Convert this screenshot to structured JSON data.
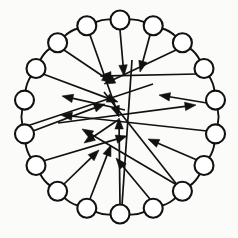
{
  "figure": {
    "title": "Ring graph with radiating direction vectors",
    "type": "node-link-diagram",
    "background_color": "#fbfbfa",
    "stroke_color": "#111111",
    "node_fill_color": "#ffffff",
    "canvas": {
      "width": 238,
      "height": 238
    }
  },
  "geometry": {
    "center": {
      "x": 120,
      "y": 117
    },
    "ring_radius": 97,
    "node_radius": 9.5,
    "node_count": 18
  },
  "nodes": [
    {
      "id": "n0",
      "label": "",
      "angle_deg": 270,
      "x": 120.0,
      "y": 20.0
    },
    {
      "id": "n1",
      "label": "",
      "angle_deg": 290,
      "x": 153.2,
      "y": 25.8
    },
    {
      "id": "n2",
      "label": "",
      "angle_deg": 310,
      "x": 182.4,
      "y": 42.7
    },
    {
      "id": "n3",
      "label": "",
      "angle_deg": 330,
      "x": 204.0,
      "y": 68.5
    },
    {
      "id": "n4",
      "label": "",
      "angle_deg": 350,
      "x": 215.5,
      "y": 100.1
    },
    {
      "id": "n5",
      "label": "",
      "angle_deg": 10,
      "x": 215.5,
      "y": 133.9
    },
    {
      "id": "n6",
      "label": "",
      "angle_deg": 30,
      "x": 204.0,
      "y": 165.5
    },
    {
      "id": "n7",
      "label": "",
      "angle_deg": 50,
      "x": 182.4,
      "y": 191.3
    },
    {
      "id": "n8",
      "label": "",
      "angle_deg": 70,
      "x": 153.2,
      "y": 208.2
    },
    {
      "id": "n9",
      "label": "",
      "angle_deg": 90,
      "x": 120.0,
      "y": 214.0
    },
    {
      "id": "n10",
      "label": "",
      "angle_deg": 110,
      "x": 86.8,
      "y": 208.2
    },
    {
      "id": "n11",
      "label": "",
      "angle_deg": 130,
      "x": 57.6,
      "y": 191.3
    },
    {
      "id": "n12",
      "label": "",
      "angle_deg": 150,
      "x": 36.0,
      "y": 165.5
    },
    {
      "id": "n13",
      "label": "",
      "angle_deg": 170,
      "x": 24.5,
      "y": 133.9
    },
    {
      "id": "n14",
      "label": "",
      "angle_deg": 190,
      "x": 24.5,
      "y": 100.1
    },
    {
      "id": "n15",
      "label": "",
      "angle_deg": 210,
      "x": 36.0,
      "y": 68.5
    },
    {
      "id": "n16",
      "label": "",
      "angle_deg": 230,
      "x": 57.6,
      "y": 42.7
    },
    {
      "id": "n17",
      "label": "",
      "angle_deg": 250,
      "x": 86.8,
      "y": 25.8
    }
  ],
  "ring_edges": [
    {
      "from": "n0",
      "to": "n1"
    },
    {
      "from": "n1",
      "to": "n2"
    },
    {
      "from": "n2",
      "to": "n3"
    },
    {
      "from": "n3",
      "to": "n4"
    },
    {
      "from": "n4",
      "to": "n5"
    },
    {
      "from": "n5",
      "to": "n6"
    },
    {
      "from": "n6",
      "to": "n7"
    },
    {
      "from": "n7",
      "to": "n8"
    },
    {
      "from": "n8",
      "to": "n9"
    },
    {
      "from": "n9",
      "to": "n10"
    },
    {
      "from": "n10",
      "to": "n11"
    },
    {
      "from": "n11",
      "to": "n12"
    },
    {
      "from": "n12",
      "to": "n13"
    },
    {
      "from": "n13",
      "to": "n14"
    },
    {
      "from": "n14",
      "to": "n15"
    },
    {
      "from": "n15",
      "to": "n16"
    },
    {
      "from": "n16",
      "to": "n17"
    },
    {
      "from": "n17",
      "to": "n0"
    }
  ],
  "vectors": [
    {
      "id": "v0",
      "from_node": "n0",
      "tail": {
        "x": 120,
        "y": 30
      },
      "head": {
        "x": 124,
        "y": 76
      },
      "direction": "down"
    },
    {
      "id": "v1",
      "from_node": "n1",
      "tail": {
        "x": 150,
        "y": 35
      },
      "head": {
        "x": 140,
        "y": 72
      },
      "direction": "down-left"
    },
    {
      "id": "v2",
      "from_node": "n2",
      "tail": {
        "x": 176,
        "y": 50
      },
      "head": {
        "x": 104,
        "y": 84
      },
      "direction": "down-left"
    },
    {
      "id": "v3",
      "from_node": "n3",
      "tail": {
        "x": 197,
        "y": 74
      },
      "head": {
        "x": 100,
        "y": 76
      },
      "direction": "left"
    },
    {
      "id": "v4",
      "from_node": "n4",
      "tail": {
        "x": 207,
        "y": 103
      },
      "head": {
        "x": 159,
        "y": 95
      },
      "direction": "left"
    },
    {
      "id": "v5",
      "from_node": "n5",
      "tail": {
        "x": 207,
        "y": 131
      },
      "head": {
        "x": 61,
        "y": 115
      },
      "direction": "left"
    },
    {
      "id": "v6",
      "from_node": "n6",
      "tail": {
        "x": 197,
        "y": 160
      },
      "head": {
        "x": 148,
        "y": 139
      },
      "direction": "up-left"
    },
    {
      "id": "v7",
      "from_node": "n7",
      "tail": {
        "x": 177,
        "y": 185
      },
      "head": {
        "x": 82,
        "y": 129
      },
      "direction": "up-left"
    },
    {
      "id": "v8",
      "from_node": "n8",
      "tail": {
        "x": 150,
        "y": 199
      },
      "head": {
        "x": 116,
        "y": 158
      },
      "direction": "up-left"
    },
    {
      "id": "v9",
      "from_node": "n9",
      "tail": {
        "x": 120,
        "y": 205
      },
      "head": {
        "x": 119,
        "y": 118
      },
      "direction": "up"
    },
    {
      "id": "v10",
      "from_node": "n10",
      "tail": {
        "x": 90,
        "y": 199
      },
      "head": {
        "x": 111,
        "y": 145
      },
      "direction": "up-right"
    },
    {
      "id": "v11",
      "from_node": "n11",
      "tail": {
        "x": 63,
        "y": 185
      },
      "head": {
        "x": 99,
        "y": 150
      },
      "direction": "up-right"
    },
    {
      "id": "v12",
      "from_node": "n12",
      "tail": {
        "x": 43,
        "y": 161
      },
      "head": {
        "x": 127,
        "y": 136
      },
      "direction": "up-right"
    },
    {
      "id": "v13",
      "from_node": "n13",
      "tail": {
        "x": 33,
        "y": 131
      },
      "head": {
        "x": 105,
        "y": 104
      },
      "direction": "up-right"
    },
    {
      "id": "v14",
      "from_node": "n14",
      "tail": {
        "x": 125,
        "y": 110
      },
      "head": {
        "x": 62,
        "y": 96
      },
      "direction": "left"
    },
    {
      "id": "v15",
      "from_node": "n15",
      "tail": {
        "x": 43,
        "y": 74
      },
      "head": {
        "x": 118,
        "y": 102
      },
      "direction": "down-right"
    },
    {
      "id": "v16",
      "from_node": "n16",
      "tail": {
        "x": 64,
        "y": 50
      },
      "head": {
        "x": 113,
        "y": 83
      },
      "direction": "down-right"
    },
    {
      "id": "v17",
      "from_node": "n17",
      "tail": {
        "x": 118,
        "y": 120
      },
      "head": {
        "x": 84,
        "y": 143
      },
      "direction": "down-left"
    },
    {
      "id": "v18",
      "from_node": "n17",
      "tail": {
        "x": 90,
        "y": 35
      },
      "head": {
        "x": 119,
        "y": 117
      },
      "direction": "down-right"
    },
    {
      "id": "v19",
      "from_node": "n3",
      "tail": {
        "x": 58,
        "y": 123
      },
      "head": {
        "x": 196,
        "y": 105
      },
      "direction": "right"
    }
  ],
  "chords": [
    {
      "id": "c0",
      "from": {
        "x": 27,
        "y": 126
      },
      "to": {
        "x": 153,
        "y": 84
      }
    },
    {
      "id": "c1",
      "from": {
        "x": 122,
        "y": 205
      },
      "to": {
        "x": 132,
        "y": 60
      }
    },
    {
      "id": "c2",
      "from": {
        "x": 178,
        "y": 186
      },
      "to": {
        "x": 104,
        "y": 92
      }
    }
  ]
}
